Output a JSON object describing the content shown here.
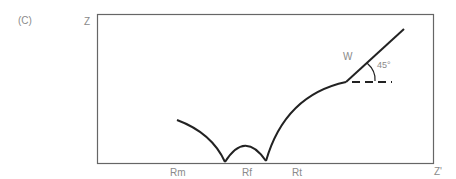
{
  "panel_label": "(C)",
  "axes": {
    "y_label": "Z",
    "x_label": "Z'"
  },
  "annotations": {
    "warburg": "W",
    "angle": "45°"
  },
  "x_markers": [
    "Rm",
    "Rf",
    "Rt"
  ],
  "colors": {
    "curve": "#222222",
    "frame": "#666666",
    "text": "#8a8a8a"
  }
}
